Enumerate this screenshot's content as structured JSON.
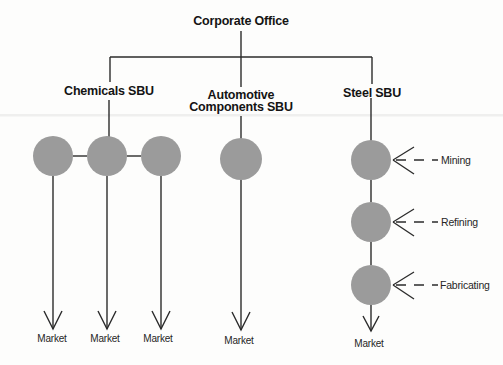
{
  "figure": {
    "type": "org-structure-diagram",
    "root": {
      "label": "Corporate Office"
    },
    "branches": [
      {
        "id": "chemicals",
        "label": "Chemicals SBU",
        "unit_circles": 3,
        "arrangement": "horizontal"
      },
      {
        "id": "automotive",
        "label_line1": "Automotive",
        "label_line2": "Components SBU",
        "unit_circles": 1,
        "arrangement": "single"
      },
      {
        "id": "steel",
        "label": "Steel SBU",
        "unit_circles": 3,
        "arrangement": "vertical"
      }
    ],
    "process_labels": {
      "mining": "Mining",
      "refining": "Refining",
      "fabricating": "Fabricating"
    },
    "markets": [
      "Market",
      "Market",
      "Market",
      "Market",
      "Market"
    ],
    "colors": {
      "background": "#fdfdfc",
      "circle_fill": "#9b9b9b",
      "line": "#2b2b2b",
      "text": "#141414"
    }
  }
}
